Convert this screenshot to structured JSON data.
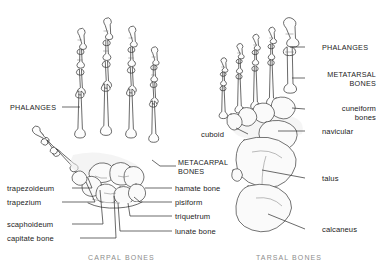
{
  "figure": {
    "ink_color": "#3a3a3a",
    "leader_color": "#2b2b2b",
    "caption_color": "#8d8d8d"
  },
  "hand": {
    "caption": "CARPAL BONES",
    "labels": {
      "phalanges": "PHALANGES",
      "metacarpal_bones_line1": "METACARPAL",
      "metacarpal_bones_line2": "BONES",
      "hamate": "hamate bone",
      "pisiform": "pisiform",
      "triquetrum": "triquetrum",
      "lunate": "lunate bone",
      "trapezoideum": "trapezoideum",
      "trapezium": "trapezium",
      "scaphoideum": "scaphoideum",
      "capitate": "capitate bone"
    }
  },
  "foot": {
    "caption": "TARSAL BONES",
    "labels": {
      "phalanges": "PHALANGES",
      "metatarsal_bones_line1": "METATARSAL",
      "metatarsal_bones_line2": "BONES",
      "cuneiform_line1": "cuneiform",
      "cuneiform_line2": "bones",
      "navicular": "navicular",
      "cuboid": "cuboid",
      "talus": "talus",
      "calcaneus": "calcaneus"
    }
  }
}
